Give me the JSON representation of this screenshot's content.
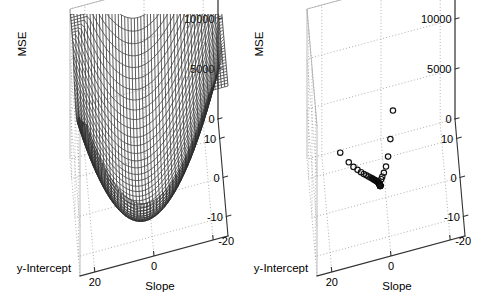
{
  "figure": {
    "title": "",
    "background_color": "#ffffff",
    "panel_count": 2
  },
  "chart_data": [
    {
      "id": "left-panel",
      "type": "surface",
      "title": "",
      "xlabel": "Slope",
      "ylabel": "y-Intercept",
      "zlabel": "MSE",
      "xticks": [
        20,
        0,
        -20
      ],
      "xticklabels": [
        "20",
        "0",
        "-20"
      ],
      "yticks": [
        10,
        0,
        -10
      ],
      "yticklabels": [
        "10",
        "0",
        "-10"
      ],
      "zticks": [
        0,
        5000,
        10000,
        15000
      ],
      "zticklabels": [
        "0",
        "5000",
        "10000",
        "15000"
      ],
      "xlim": [
        -25,
        25
      ],
      "ylim": [
        -15,
        15
      ],
      "zlim": [
        0,
        15000
      ],
      "grid": true,
      "legend": null,
      "surface_style": "dark-wireframe-mesh",
      "surface_color": "#2e2e2e",
      "description": "Convex paraboloid mean-squared-error cost surface over slope and y-intercept",
      "surface_model": {
        "form": "z = a*(x - x0)^2 + b*(y - y0)^2",
        "a": 22.0,
        "b": 38.0,
        "x0": 2.0,
        "y0": -3.0,
        "zmax": 15000
      }
    },
    {
      "id": "right-panel",
      "type": "scatter3d",
      "title": "",
      "xlabel": "Slope",
      "ylabel": "y-Intercept",
      "zlabel": "MSE",
      "xticks": [
        20,
        0,
        -20
      ],
      "xticklabels": [
        "20",
        "0",
        "-20"
      ],
      "yticks": [
        10,
        0,
        -10
      ],
      "yticklabels": [
        "10",
        "0",
        "-10"
      ],
      "zticks": [
        0,
        5000,
        10000,
        15000
      ],
      "zticklabels": [
        "0",
        "5000",
        "10000",
        "15000"
      ],
      "xlim": [
        -25,
        25
      ],
      "ylim": [
        -15,
        15
      ],
      "zlim": [
        0,
        15000
      ],
      "grid": true,
      "legend": null,
      "marker": "open-circle",
      "marker_color": "#111111",
      "description": "Gradient-descent iterates converging toward the minimum of the MSE surface",
      "points": [
        {
          "x": 14.2,
          "y": 11.2,
          "z": 1250
        },
        {
          "x": 11.5,
          "y": 9.6,
          "z": 700
        },
        {
          "x": 10.0,
          "y": 8.8,
          "z": 430
        },
        {
          "x": 8.7,
          "y": 8.1,
          "z": 300
        },
        {
          "x": 7.6,
          "y": 7.5,
          "z": 215
        },
        {
          "x": 6.7,
          "y": 7.0,
          "z": 160
        },
        {
          "x": 5.9,
          "y": 6.6,
          "z": 120
        },
        {
          "x": 5.2,
          "y": 6.2,
          "z": 95
        },
        {
          "x": 4.6,
          "y": 5.9,
          "z": 75
        },
        {
          "x": 4.1,
          "y": 5.6,
          "z": 60
        },
        {
          "x": 3.7,
          "y": 5.3,
          "z": 48
        },
        {
          "x": 3.3,
          "y": 5.1,
          "z": 40
        },
        {
          "x": 3.0,
          "y": 4.9,
          "z": 33
        },
        {
          "x": 2.7,
          "y": 4.7,
          "z": 28
        },
        {
          "x": 2.5,
          "y": 4.6,
          "z": 24
        },
        {
          "x": 2.3,
          "y": 4.4,
          "z": 20
        },
        {
          "x": 2.15,
          "y": 4.3,
          "z": 17
        },
        {
          "x": 2.05,
          "y": 4.2,
          "z": 15
        },
        {
          "x": 1.95,
          "y": 4.1,
          "z": 13
        },
        {
          "x": 1.9,
          "y": 4.0,
          "z": 11
        },
        {
          "x": 1.85,
          "y": 3.95,
          "z": 9
        },
        {
          "x": 1.8,
          "y": 3.9,
          "z": 8
        },
        {
          "x": 1.78,
          "y": 3.85,
          "z": 7
        },
        {
          "x": 1.76,
          "y": 3.8,
          "z": 6
        },
        {
          "x": 1.74,
          "y": 3.78,
          "z": 5
        },
        {
          "x": 1.72,
          "y": 3.75,
          "z": 4
        },
        {
          "x": 1.7,
          "y": 3.72,
          "z": 3
        },
        {
          "x": 1.69,
          "y": 3.7,
          "z": 3
        },
        {
          "x": 1.68,
          "y": 3.68,
          "z": 2
        },
        {
          "x": 1.67,
          "y": 3.66,
          "z": 2
        },
        {
          "x": 1.66,
          "y": 3.64,
          "z": 1
        },
        {
          "x": 1.65,
          "y": 3.62,
          "z": 1
        },
        {
          "x": 1.65,
          "y": 3.6,
          "z": 1
        },
        {
          "x": 1.64,
          "y": 3.58,
          "z": 0
        },
        {
          "x": 1.64,
          "y": 3.56,
          "z": 0
        },
        {
          "x": 1.63,
          "y": 3.54,
          "z": 0
        },
        {
          "x": 1.63,
          "y": 3.52,
          "z": 0
        },
        {
          "x": 1.62,
          "y": 3.5,
          "z": 0
        },
        {
          "x": 1.62,
          "y": 3.48,
          "z": 0
        },
        {
          "x": 1.62,
          "y": 3.46,
          "z": 0
        },
        {
          "x": 1.61,
          "y": 3.44,
          "z": 0
        },
        {
          "x": 1.61,
          "y": 3.42,
          "z": 0
        },
        {
          "x": 1.61,
          "y": 3.4,
          "z": 0
        },
        {
          "x": 1.6,
          "y": 3.38,
          "z": 0
        },
        {
          "x": 1.6,
          "y": 3.36,
          "z": 0
        },
        {
          "x": 1.6,
          "y": 3.34,
          "z": 0
        },
        {
          "x": 1.6,
          "y": 3.32,
          "z": 0
        },
        {
          "x": 1.6,
          "y": 3.3,
          "z": 0
        },
        {
          "x": 1.59,
          "y": 3.28,
          "z": 0
        },
        {
          "x": 1.59,
          "y": 3.26,
          "z": 0
        },
        {
          "x": -3.4,
          "y": 9.3,
          "z": 4800
        },
        {
          "x": -2.4,
          "y": 8.2,
          "z": 2450
        },
        {
          "x": -1.5,
          "y": 7.1,
          "z": 1200
        },
        {
          "x": -0.7,
          "y": 6.2,
          "z": 620
        },
        {
          "x": 0.1,
          "y": 5.5,
          "z": 330
        },
        {
          "x": 0.7,
          "y": 5.0,
          "z": 190
        },
        {
          "x": 1.1,
          "y": 4.6,
          "z": 120
        }
      ]
    }
  ]
}
